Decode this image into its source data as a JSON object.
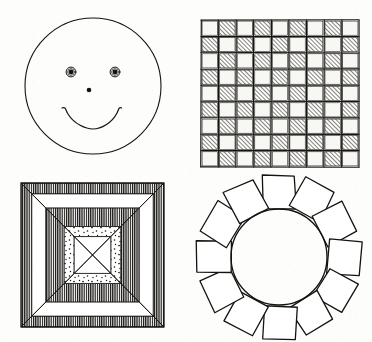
{
  "document": {
    "title": "Line Art Pattern Figures",
    "medium": "black ink line drawing on off-white paper",
    "background_color": "#fdfdfc",
    "ink_color": "#15130f",
    "layout": "2x2 grid of four separate figures",
    "width": 372,
    "height": 342
  },
  "figures": [
    {
      "id": "smiley-face",
      "name": "Smiley Face",
      "position": "top-left",
      "description": "A large open circle containing two ringed eyes, a small dot nose and an upturned arc mouth",
      "outline": {
        "shape": "circle",
        "cx": 93,
        "cy": 86,
        "r": 68,
        "filled": false
      },
      "eyes": {
        "count": 2,
        "style": "ring with solid pupil",
        "left": {
          "cx": 71,
          "cy": 72,
          "outer_r": 5.0,
          "pupil_r": 2.4
        },
        "right": {
          "cx": 115,
          "cy": 72,
          "outer_r": 5.0,
          "pupil_r": 2.4
        }
      },
      "nose": {
        "shape": "dot",
        "cx": 89,
        "cy": 90,
        "r": 2.3
      },
      "mouth": {
        "shape": "arc",
        "start_x": 62,
        "start_y": 108,
        "end_x": 117,
        "end_y": 108,
        "curve": "concave-up smile"
      }
    },
    {
      "id": "hatched-checkerboard",
      "name": "Hatched Checkerboard Grid",
      "position": "top-right",
      "description": "A square grid of 9 by 9 cells alternating between plain white squares and squares filled with diagonal hatching",
      "rows": 9,
      "columns": 9,
      "cell_count": 81,
      "bounds": {
        "x": 201,
        "y": 20,
        "width": 158,
        "height": 147
      },
      "hatched_cells": 40,
      "plain_cells": 41,
      "top_left_cell": "plain",
      "hatch_direction": "diagonal, lower-left to upper-right",
      "hatch_spacing_px": 3,
      "grid_line_color": "#3a3630"
    },
    {
      "id": "cross-bands",
      "name": "Banded X Cross Square",
      "position": "bottom-left",
      "description": "A square divided by a large diagonal X into chevron bands of alternating texture: white, stippled dots, and dense vertical hatching",
      "bounds": {
        "x": 21,
        "y": 183,
        "width": 143,
        "height": 144
      },
      "band_sequence_from_center": [
        "white",
        "stippled",
        "dark-hatched",
        "white",
        "dark-hatched"
      ],
      "symmetry": "four-fold, mirrored across both diagonals",
      "center_line": "thin diagonal cross through the middle",
      "textures": {
        "stippled": "scattered small dots",
        "dark-hatched": "dense vertical line shading"
      }
    },
    {
      "id": "square-rosette",
      "name": "Ring of Squares Around Circle",
      "position": "bottom-right",
      "description": "A central circle surrounded by twelve small squares arranged radially like petals",
      "circle": {
        "cx": 279,
        "cy": 257,
        "r": 48
      },
      "square_count": 12,
      "angular_step_degrees": 30,
      "square_size_px": 33,
      "orientation": "each square rotated to face outward from the circle centre",
      "style": "hand-drawn, slightly irregular outlines"
    }
  ]
}
